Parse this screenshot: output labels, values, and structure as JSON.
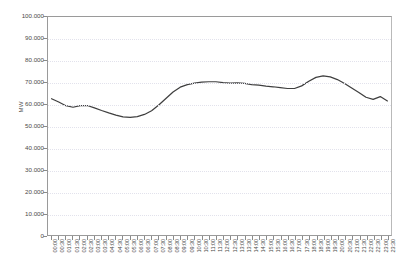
{
  "chart_data": {
    "type": "line",
    "title": "",
    "xlabel": "",
    "ylabel": "MW",
    "ylim": [
      0,
      100000
    ],
    "ytick_labels": [
      "100.000",
      "90.000",
      "80.000",
      "70.000",
      "60.000",
      "50.000",
      "40.000",
      "30.000",
      "20.000",
      "10.000",
      "0"
    ],
    "ytick_values": [
      100000,
      90000,
      80000,
      70000,
      60000,
      50000,
      40000,
      30000,
      20000,
      10000,
      0
    ],
    "grid": true,
    "legend": "none",
    "line_color": "#3f3f3f",
    "categories": [
      "00:00",
      "00:30",
      "01:00",
      "01:30",
      "02:00",
      "02:30",
      "03:00",
      "03:30",
      "04:00",
      "04:30",
      "05:00",
      "05:30",
      "06:00",
      "06:30",
      "07:00",
      "07:30",
      "08:00",
      "08:30",
      "09:00",
      "09:30",
      "10:00",
      "10:30",
      "11:00",
      "11:30",
      "12:00",
      "12:30",
      "13:00",
      "13:30",
      "14:00",
      "14:30",
      "15:00",
      "15:30",
      "16:00",
      "16:30",
      "17:00",
      "17:30",
      "18:00",
      "18:30",
      "19:00",
      "19:30",
      "20:00",
      "20:30",
      "21:00",
      "21:30",
      "22:00",
      "22:30",
      "23:00",
      "23:30"
    ],
    "series": [
      {
        "name": "Load",
        "values": [
          62500,
          61000,
          59300,
          58600,
          59300,
          59400,
          58300,
          57100,
          56000,
          55000,
          54200,
          54000,
          54300,
          55300,
          57000,
          59600,
          62600,
          65600,
          67800,
          69000,
          69700,
          70100,
          70300,
          70300,
          69900,
          69700,
          69800,
          69600,
          69000,
          68700,
          68300,
          68000,
          67600,
          67200,
          67200,
          68400,
          70500,
          72300,
          73000,
          72500,
          71300,
          69500,
          67400,
          65400,
          63200,
          62200,
          63500,
          61500
        ]
      }
    ]
  }
}
